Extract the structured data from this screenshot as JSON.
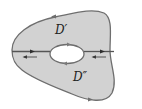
{
  "diagram": {
    "type": "region-decomposition",
    "colors": {
      "fill": "#d2d2d2",
      "boundary": "#6e6e6e",
      "cut": "#555555",
      "arrow": "#3a3a3a",
      "hole": "#ffffff",
      "background": "#ffffff"
    },
    "labels": {
      "upper_region": "D′",
      "lower_region": "D″"
    },
    "arrows": {
      "outer_top": "left",
      "outer_bottom": "right",
      "hole_top": "right",
      "hole_bottom": "left",
      "cut_left_upper": "right",
      "cut_left_lower": "left",
      "cut_right_upper": "right",
      "cut_right_lower": "left"
    }
  }
}
